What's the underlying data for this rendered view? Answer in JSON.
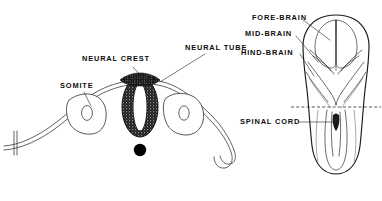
{
  "figure": {
    "background_color": "#ffffff",
    "ink_color": "#111111",
    "label_color": "#0d0d0d"
  },
  "labels": {
    "neural_crest": "NEURAL CREST",
    "somite": "SOMITE",
    "neural_tube": "NEURAL TUBE",
    "fore_brain": "FORE-BRAIN",
    "mid_brain": "MID-BRAIN",
    "hind_brain": "HIND-BRAIN",
    "spinal_cord": "SPINAL CORD"
  },
  "structures": {
    "cross_section": {
      "name": "embryo cross-section",
      "parts": [
        "ectoderm",
        "neural-crest",
        "neural-tube",
        "notochord",
        "somite-left",
        "somite-right"
      ]
    },
    "dorsal_view": {
      "name": "dorsal view of neural tube and brain",
      "parts": [
        "fore-brain",
        "mid-brain",
        "hind-brain",
        "spinal-cord",
        "section-level-dashed-line"
      ]
    }
  }
}
